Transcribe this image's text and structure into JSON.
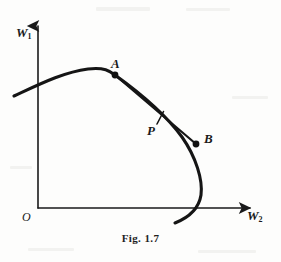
{
  "figure": {
    "caption": "Fig. 1.7",
    "background_color": "#fdfdfc",
    "ink_color": "#1a1a1a",
    "axes": {
      "y_axis_label": "W",
      "y_axis_subscript": "1",
      "x_axis_label": "W",
      "x_axis_subscript": "2",
      "origin_label": "O",
      "y_axis_x": 38,
      "y_axis_top": 22,
      "x_axis_y": 208,
      "x_axis_right": 256
    },
    "points": [
      {
        "id": "A",
        "label": "A",
        "x": 115,
        "y": 75,
        "marker": "filled-dot",
        "label_dx": -4,
        "label_dy": -18
      },
      {
        "id": "P",
        "label": "P",
        "x": 160,
        "y": 118,
        "marker": "tick",
        "label_dx": -13,
        "label_dy": 6
      },
      {
        "id": "B",
        "label": "B",
        "x": 196,
        "y": 144,
        "marker": "filled-dot",
        "label_dx": 8,
        "label_dy": -12
      }
    ],
    "curve": {
      "name": "production-possibility-frontier",
      "description": "concave arc from upper-left through A, bulging right past B, crossing the horizontal axis",
      "path": "M 14,96 C 40,84 64,72 88,69 C 104,67 110,71 115,75 C 140,93 166,115 182,137 C 196,157 203,180 201,195 C 199,208 190,217 175,223"
    },
    "chord": {
      "name": "chord-A-B",
      "from": "A",
      "to": "B",
      "path": "M 115,75 L 196,144"
    }
  },
  "chart_data": {
    "type": "line",
    "title": "Fig. 1.7",
    "xlabel": "W2",
    "ylabel": "W1",
    "grid": false,
    "legend": "none",
    "annotations": [
      "A",
      "P",
      "B",
      "O"
    ],
    "series": [
      {
        "name": "frontier-curve",
        "points": [
          [
            14,
            96
          ],
          [
            40,
            84
          ],
          [
            64,
            72
          ],
          [
            88,
            69
          ],
          [
            115,
            75
          ],
          [
            150,
            101
          ],
          [
            182,
            137
          ],
          [
            201,
            180
          ],
          [
            189,
            214
          ],
          [
            175,
            223
          ]
        ]
      },
      {
        "name": "chord-A-B",
        "points": [
          [
            115,
            75
          ],
          [
            196,
            144
          ]
        ]
      }
    ]
  }
}
